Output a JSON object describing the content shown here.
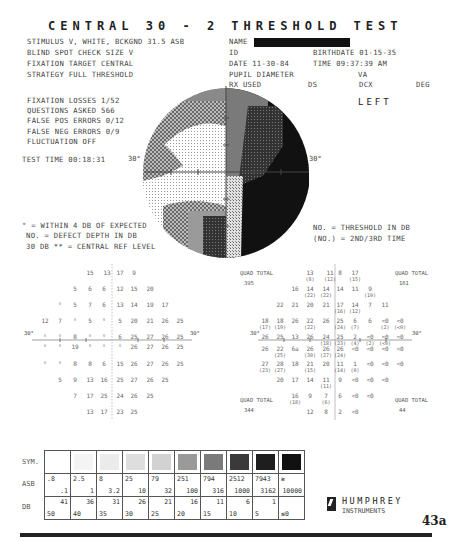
{
  "header": {
    "title": "CENTRAL 30 - 2 THRESHOLD TEST",
    "stimulus": "STIMULUS    V, WHITE, BCKGND 31.5 ASB",
    "blind_spot": "BLIND SPOT CHECK SIZE   V",
    "fixation_target": "FIXATION TARGET   CENTRAL",
    "strategy": "STRATEGY   FULL THRESHOLD",
    "name_label": "NAME",
    "id_label": "ID",
    "birthdate": "BIRTHDATE  01-15-35",
    "date": "DATE  11-30-84",
    "time": "TIME  09:37:39 AM",
    "pupil": "PUPIL DIAMETER",
    "va": "VA",
    "rx_used": "RX USED",
    "ds": "DS",
    "dcx": "DCX",
    "deg": "DEG",
    "eye": "LEFT"
  },
  "reliability": {
    "fixation_losses": "FIXATION LOSSES  1/52",
    "questions_asked": "QUESTIONS ASKED  566",
    "false_pos": "FALSE POS ERRORS 0/12",
    "false_neg": "FALSE NEG ERRORS 0/9",
    "fluctuation": "FLUCTUATION   OFF",
    "test_time": "TEST TIME 00:18:31"
  },
  "graymap": {
    "left_axis": "30°",
    "right_axis": "30°"
  },
  "legend_notes": {
    "within": "° = WITHIN 4 DB OF EXPECTED",
    "defect": "NO. = DEFECT DEPTH IN DB",
    "central_ref": "30 DB ** = CENTRAL REF LEVEL",
    "threshold": "NO.  = THRESHOLD IN DB",
    "second": "(NO.) = 2ND/3RD TIME"
  },
  "defect_grid": {
    "axis_left": "30°",
    "axis_right": "30°",
    "rows": [
      {
        "y": 270,
        "cells": [
          [
            90,
            "15"
          ],
          [
            107,
            "13"
          ],
          [
            120,
            "17"
          ],
          [
            134,
            "9"
          ]
        ]
      },
      {
        "y": 286,
        "cells": [
          [
            75,
            "5"
          ],
          [
            90,
            "6"
          ],
          [
            104,
            "6"
          ],
          [
            120,
            "12"
          ],
          [
            134,
            "15"
          ],
          [
            150,
            "20"
          ]
        ]
      },
      {
        "y": 302,
        "cells": [
          [
            60,
            "°"
          ],
          [
            75,
            "5"
          ],
          [
            90,
            "7"
          ],
          [
            104,
            "6"
          ],
          [
            120,
            "13"
          ],
          [
            134,
            "14"
          ],
          [
            150,
            "19"
          ],
          [
            165,
            "17"
          ]
        ]
      },
      {
        "y": 318,
        "cells": [
          [
            45,
            "12"
          ],
          [
            60,
            "7"
          ],
          [
            75,
            "°"
          ],
          [
            90,
            "5"
          ],
          [
            104,
            "°"
          ],
          [
            120,
            "5"
          ],
          [
            134,
            "20"
          ],
          [
            150,
            "21"
          ],
          [
            165,
            "26"
          ],
          [
            180,
            "25"
          ]
        ]
      },
      {
        "y": 334,
        "cells": [
          [
            45,
            "°"
          ],
          [
            60,
            "°"
          ],
          [
            75,
            "8"
          ],
          [
            90,
            "°"
          ],
          [
            104,
            "°"
          ],
          [
            120,
            "6"
          ],
          [
            134,
            "25"
          ],
          [
            150,
            "27"
          ],
          [
            165,
            "26"
          ],
          [
            180,
            "25"
          ]
        ]
      },
      {
        "y": 344,
        "cells": [
          [
            45,
            "°"
          ],
          [
            60,
            "°"
          ],
          [
            75,
            "19"
          ],
          [
            90,
            "°"
          ],
          [
            104,
            "°"
          ],
          [
            120,
            "°"
          ],
          [
            134,
            "26"
          ],
          [
            150,
            "27"
          ],
          [
            165,
            "26"
          ],
          [
            180,
            "25"
          ]
        ]
      },
      {
        "y": 361,
        "cells": [
          [
            45,
            "°"
          ],
          [
            60,
            "°"
          ],
          [
            75,
            "8"
          ],
          [
            90,
            "8"
          ],
          [
            104,
            "6"
          ],
          [
            120,
            "15"
          ],
          [
            134,
            "26"
          ],
          [
            150,
            "27"
          ],
          [
            165,
            "26"
          ],
          [
            180,
            "25"
          ]
        ]
      },
      {
        "y": 377,
        "cells": [
          [
            60,
            "5"
          ],
          [
            75,
            "9"
          ],
          [
            90,
            "13"
          ],
          [
            104,
            "16"
          ],
          [
            120,
            "25"
          ],
          [
            134,
            "27"
          ],
          [
            150,
            "26"
          ],
          [
            165,
            "25"
          ]
        ]
      },
      {
        "y": 393,
        "cells": [
          [
            75,
            "7"
          ],
          [
            90,
            "17"
          ],
          [
            104,
            "25"
          ],
          [
            120,
            "24"
          ],
          [
            134,
            "26"
          ],
          [
            150,
            "25"
          ]
        ]
      },
      {
        "y": 409,
        "cells": [
          [
            90,
            "13"
          ],
          [
            104,
            "17"
          ],
          [
            120,
            "23"
          ],
          [
            134,
            "25"
          ]
        ]
      }
    ]
  },
  "threshold_grid": {
    "axis_left": "30°",
    "axis_right": "30°",
    "quad_totals": [
      {
        "label": "QUAD TOTAL",
        "value": "395",
        "x": 240,
        "y": 270
      },
      {
        "label": "QUAD TOTAL",
        "value": "161",
        "x": 395,
        "y": 270
      },
      {
        "label": "QUAD TOTAL",
        "value": "344",
        "x": 240,
        "y": 397
      },
      {
        "label": "QUAD TOTAL",
        "value": "44",
        "x": 395,
        "y": 397
      }
    ],
    "rows": [
      {
        "y": 270,
        "cells": [
          [
            310,
            "13",
            "(8)"
          ],
          [
            330,
            "11",
            "(12)"
          ],
          [
            340,
            "8",
            ""
          ],
          [
            355,
            "17",
            "(15)"
          ]
        ]
      },
      {
        "y": 286,
        "cells": [
          [
            295,
            "16",
            ""
          ],
          [
            310,
            "14",
            "(22)"
          ],
          [
            326,
            "14",
            "(22)"
          ],
          [
            340,
            "14",
            ""
          ],
          [
            355,
            "11",
            ""
          ],
          [
            370,
            "9",
            "(10)"
          ]
        ]
      },
      {
        "y": 302,
        "cells": [
          [
            280,
            "22",
            ""
          ],
          [
            295,
            "21",
            ""
          ],
          [
            310,
            "20",
            ""
          ],
          [
            326,
            "21",
            ""
          ],
          [
            340,
            "17",
            "(16)"
          ],
          [
            355,
            "14",
            "(12)"
          ],
          [
            370,
            "7",
            ""
          ],
          [
            385,
            "11",
            ""
          ]
        ]
      },
      {
        "y": 318,
        "cells": [
          [
            265,
            "18",
            "(17)"
          ],
          [
            280,
            "18",
            "(19)"
          ],
          [
            295,
            "26",
            ""
          ],
          [
            310,
            "22",
            "(22)"
          ],
          [
            326,
            "26",
            ""
          ],
          [
            340,
            "25",
            "(24)"
          ],
          [
            355,
            "6",
            "(7)"
          ],
          [
            370,
            "6",
            ""
          ],
          [
            385,
            "<0",
            "(2)"
          ],
          [
            400,
            "<0",
            "(<0)"
          ]
        ]
      },
      {
        "y": 334,
        "cells": [
          [
            265,
            "26",
            ""
          ],
          [
            280,
            "25",
            ""
          ],
          [
            295,
            "13",
            ""
          ],
          [
            310,
            "26",
            ""
          ],
          [
            326,
            "24",
            "(18)"
          ],
          [
            340,
            "25",
            "(23)"
          ],
          [
            355,
            "2",
            "(4)"
          ],
          [
            370,
            "<0",
            "(2)"
          ],
          [
            385,
            "<0",
            "(<0)"
          ],
          [
            400,
            "<0",
            ""
          ]
        ]
      },
      {
        "y": 346,
        "cells": [
          [
            265,
            "26",
            ""
          ],
          [
            280,
            "22",
            "(25)"
          ],
          [
            295,
            "6a",
            ""
          ],
          [
            310,
            "26",
            "(30)"
          ],
          [
            326,
            "26",
            "(27)"
          ],
          [
            340,
            "26",
            "(24)"
          ],
          [
            355,
            "<0",
            ""
          ],
          [
            370,
            "<0",
            ""
          ],
          [
            385,
            "<0",
            ""
          ],
          [
            400,
            "<0",
            ""
          ]
        ]
      },
      {
        "y": 361,
        "cells": [
          [
            265,
            "27",
            "(23)"
          ],
          [
            280,
            "28",
            "(27)"
          ],
          [
            295,
            "18",
            ""
          ],
          [
            310,
            "21",
            "(15)"
          ],
          [
            326,
            "20",
            ""
          ],
          [
            340,
            "11",
            "(14)"
          ],
          [
            355,
            "1",
            "(0)"
          ],
          [
            370,
            "<0",
            ""
          ],
          [
            385,
            "<0",
            ""
          ],
          [
            400,
            "<0",
            ""
          ]
        ]
      },
      {
        "y": 377,
        "cells": [
          [
            280,
            "20",
            ""
          ],
          [
            295,
            "17",
            ""
          ],
          [
            310,
            "14",
            ""
          ],
          [
            326,
            "11",
            "(11)"
          ],
          [
            340,
            "9",
            ""
          ],
          [
            355,
            "<0",
            ""
          ],
          [
            370,
            "<0",
            ""
          ],
          [
            385,
            "<0",
            ""
          ]
        ]
      },
      {
        "y": 393,
        "cells": [
          [
            295,
            "16",
            "(18)"
          ],
          [
            310,
            "9",
            ""
          ],
          [
            326,
            "7",
            "(6)"
          ],
          [
            340,
            "6",
            ""
          ],
          [
            355,
            "<0",
            ""
          ],
          [
            370,
            "<0",
            ""
          ]
        ]
      },
      {
        "y": 409,
        "cells": [
          [
            310,
            "12",
            ""
          ],
          [
            326,
            "8",
            ""
          ],
          [
            340,
            "2",
            ""
          ],
          [
            355,
            "<0",
            ""
          ]
        ]
      }
    ]
  },
  "scale_table": {
    "row_labels": {
      "sym": "SYM.",
      "asb": "ASB",
      "db": "DB"
    },
    "columns": [
      {
        "asb_top": ".8",
        "asb_bot": ".1",
        "db_top": "41",
        "db_bot": "50",
        "fill": "#ffffff"
      },
      {
        "asb_top": "2.5",
        "asb_bot": "1",
        "db_top": "36",
        "db_bot": "40",
        "fill": "#f4f4f4"
      },
      {
        "asb_top": "8",
        "asb_bot": "3.2",
        "db_top": "31",
        "db_bot": "35",
        "fill": "#ebebeb"
      },
      {
        "asb_top": "25",
        "asb_bot": "10",
        "db_top": "26",
        "db_bot": "30",
        "fill": "#dedede"
      },
      {
        "asb_top": "79",
        "asb_bot": "32",
        "db_top": "21",
        "db_bot": "25",
        "fill": "#d2d2d2"
      },
      {
        "asb_top": "251",
        "asb_bot": "100",
        "db_top": "16",
        "db_bot": "20",
        "fill": "#9a9a9a"
      },
      {
        "asb_top": "794",
        "asb_bot": "316",
        "db_top": "11",
        "db_bot": "15",
        "fill": "#7a7a7a"
      },
      {
        "asb_top": "2512",
        "asb_bot": "1000",
        "db_top": "6",
        "db_bot": "10",
        "fill": "#3a3a3a"
      },
      {
        "asb_top": "7943",
        "asb_bot": "3162",
        "db_top": "1",
        "db_bot": "5",
        "fill": "#1e1e1e"
      },
      {
        "asb_top": "≥",
        "asb_bot": "10000",
        "db_top": "",
        "db_bot": "≤0",
        "fill": "#111111"
      }
    ]
  },
  "footer": {
    "brand": "HUMPHREY",
    "brand_sub": "INSTRUMENTS",
    "page": "43a"
  }
}
